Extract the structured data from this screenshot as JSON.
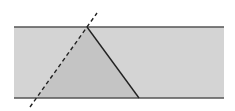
{
  "diagram": {
    "width": 235,
    "height": 111,
    "background": "#ffffff",
    "strip": {
      "x": 14,
      "y": 27,
      "width": 210,
      "height": 71,
      "fill": "#d4d4d4",
      "edge_color": "#555555"
    },
    "triangle": {
      "points": "87,27 37,98 139,98",
      "fill": "#c4c4c4",
      "edge_color": "#222222"
    },
    "dashed_line": {
      "x1": 30,
      "y1": 107,
      "x2": 97,
      "y2": 13,
      "color": "#222222",
      "dash": "4,3"
    }
  }
}
